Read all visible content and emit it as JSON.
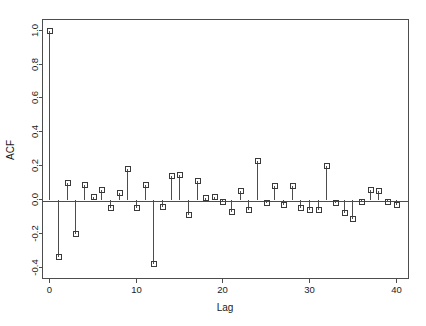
{
  "chart_data": {
    "type": "line",
    "plot_kind": "acf-stem-plot",
    "title": "",
    "xlabel": "Lag",
    "ylabel": "ACF",
    "xlim": [
      -0.8,
      41.5
    ],
    "ylim": [
      -0.47,
      1.06
    ],
    "grid": false,
    "legend": null,
    "x_ticks": [
      0,
      10,
      20,
      30,
      40
    ],
    "x_tick_labels": [
      "0",
      "10",
      "20",
      "30",
      "40"
    ],
    "y_ticks": [
      1.0,
      0.8,
      0.6,
      0.4,
      0.2,
      0.0,
      -0.2,
      -0.4
    ],
    "y_tick_labels": [
      "1.0",
      "0.8",
      "0.6",
      "0.4",
      "0.2",
      "0.0",
      "-0.2",
      "-0.4"
    ],
    "x": [
      0,
      1,
      2,
      3,
      4,
      5,
      6,
      7,
      8,
      9,
      10,
      11,
      12,
      13,
      14,
      15,
      16,
      17,
      18,
      19,
      20,
      21,
      22,
      23,
      24,
      25,
      26,
      27,
      28,
      29,
      30,
      31,
      32,
      33,
      34,
      35,
      36,
      37,
      38,
      39,
      40
    ],
    "values": [
      1.0,
      -0.34,
      0.1,
      -0.2,
      0.09,
      0.02,
      0.06,
      -0.05,
      0.04,
      0.18,
      -0.05,
      0.09,
      -0.38,
      -0.04,
      0.14,
      0.15,
      -0.09,
      0.11,
      0.01,
      0.02,
      -0.01,
      -0.07,
      0.05,
      -0.06,
      0.23,
      -0.02,
      0.08,
      -0.03,
      0.08,
      -0.05,
      -0.06,
      -0.06,
      0.2,
      -0.02,
      -0.08,
      -0.11,
      -0.01,
      0.06,
      0.05,
      -0.01,
      -0.03
    ],
    "series": [
      {
        "name": "ACF",
        "values": [
          1.0,
          -0.34,
          0.1,
          -0.2,
          0.09,
          0.02,
          0.06,
          -0.05,
          0.04,
          0.18,
          -0.05,
          0.09,
          -0.38,
          -0.04,
          0.14,
          0.15,
          -0.09,
          0.11,
          0.01,
          0.02,
          -0.01,
          -0.07,
          0.05,
          -0.06,
          0.23,
          -0.02,
          0.08,
          -0.03,
          0.08,
          -0.05,
          -0.06,
          -0.06,
          0.2,
          -0.02,
          -0.08,
          -0.11,
          -0.01,
          0.06,
          0.05,
          -0.01,
          -0.03
        ]
      }
    ],
    "marker": "open-square",
    "colors": {
      "stem": "#4d4d4d",
      "marker_stroke": "#3a3a3a",
      "axis": "#4d4d4d",
      "text": "#1a1a1a",
      "background": "#ffffff"
    }
  }
}
